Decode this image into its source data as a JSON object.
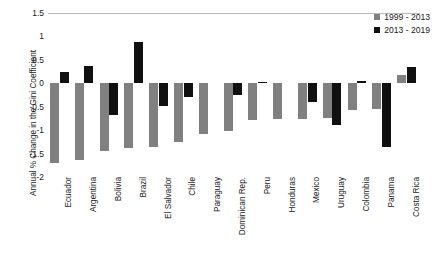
{
  "chart_data": {
    "type": "bar",
    "title": "",
    "xlabel": "",
    "ylabel": "Annual % Change in the Gini Coefficient",
    "ylim": [
      -2,
      1.5
    ],
    "yticks": [
      1.5,
      1,
      0.5,
      0,
      -0.5,
      -1,
      -1.5,
      -2
    ],
    "ytick_labels": [
      "1.5",
      "1",
      "0.5",
      "0",
      "-0.5",
      "-1",
      "-1.5",
      "-2"
    ],
    "grid": false,
    "legend_position": "top-right",
    "categories": [
      "Ecuador",
      "Argentina",
      "Bolivia",
      "Brazil",
      "El Salvador",
      "Chile",
      "Paraguay",
      "Dominican Rep.",
      "Peru",
      "Honduras",
      "Mexico",
      "Uruguay",
      "Colombia",
      "Panama",
      "Costa Rica"
    ],
    "series": [
      {
        "name": "1999 - 2013",
        "color": "#808080",
        "values": [
          -1.7,
          -1.63,
          -1.45,
          -1.38,
          -1.35,
          -1.25,
          -1.08,
          -1.01,
          -0.79,
          -0.77,
          -0.76,
          -0.74,
          -0.58,
          -0.54,
          0.18
        ]
      },
      {
        "name": "2013 - 2019",
        "color": "#101010",
        "values": [
          0.25,
          0.36,
          -0.67,
          0.88,
          -0.48,
          -0.3,
          0.0,
          -0.26,
          0.02,
          0.0,
          -0.39,
          -0.88,
          0.05,
          -1.35,
          0.35
        ]
      }
    ]
  },
  "legend": {
    "items": [
      {
        "label": "1999 - 2013",
        "color": "#808080"
      },
      {
        "label": "2013 - 2019",
        "color": "#101010"
      }
    ]
  },
  "colors": {
    "series_1999_2013": "#808080",
    "series_2013_2019": "#101010",
    "axis_line": "#b9b9b9",
    "text": "#1a1a1a",
    "background": "#ffffff"
  }
}
